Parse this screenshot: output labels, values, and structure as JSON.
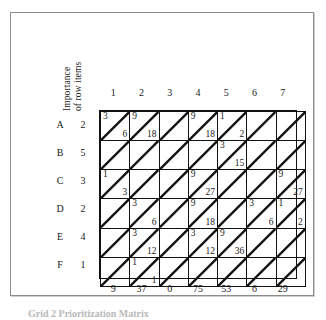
{
  "figure": {
    "row_axis_label_line1": "Importance",
    "row_axis_label_line2": "of row items",
    "caption": "Grid 2  Prioritization Matrix"
  },
  "chart_data": {
    "type": "table",
    "title": "Prioritization matrix",
    "xlabel": "",
    "ylabel": "Importance of row items",
    "grid": true,
    "legend": "none",
    "columns": [
      "1",
      "2",
      "3",
      "4",
      "5",
      "6",
      "7"
    ],
    "rows": [
      "A",
      "B",
      "C",
      "D",
      "E",
      "F"
    ],
    "row_importance": [
      2,
      5,
      3,
      2,
      4,
      1
    ],
    "column_totals": [
      9,
      37,
      0,
      75,
      53,
      6,
      29
    ],
    "cell_notation": "upper-left value = rating, lower-right value = rating x row importance",
    "cells": [
      [
        {
          "top": "3",
          "bottom": "6"
        },
        {
          "top": "9",
          "bottom": "18"
        },
        {
          "top": "",
          "bottom": ""
        },
        {
          "top": "9",
          "bottom": "18"
        },
        {
          "top": "1",
          "bottom": "2"
        },
        {
          "top": "",
          "bottom": ""
        },
        {
          "top": "",
          "bottom": ""
        }
      ],
      [
        {
          "top": "",
          "bottom": ""
        },
        {
          "top": "",
          "bottom": ""
        },
        {
          "top": "",
          "bottom": ""
        },
        {
          "top": "",
          "bottom": ""
        },
        {
          "top": "3",
          "bottom": "15"
        },
        {
          "top": "",
          "bottom": ""
        },
        {
          "top": "",
          "bottom": ""
        }
      ],
      [
        {
          "top": "1",
          "bottom": "3"
        },
        {
          "top": "",
          "bottom": ""
        },
        {
          "top": "",
          "bottom": ""
        },
        {
          "top": "9",
          "bottom": "27"
        },
        {
          "top": "",
          "bottom": ""
        },
        {
          "top": "",
          "bottom": ""
        },
        {
          "top": "9",
          "bottom": "27"
        }
      ],
      [
        {
          "top": "",
          "bottom": ""
        },
        {
          "top": "3",
          "bottom": "6"
        },
        {
          "top": "",
          "bottom": ""
        },
        {
          "top": "9",
          "bottom": "18"
        },
        {
          "top": "",
          "bottom": ""
        },
        {
          "top": "3",
          "bottom": "6"
        },
        {
          "top": "1",
          "bottom": "2"
        }
      ],
      [
        {
          "top": "",
          "bottom": ""
        },
        {
          "top": "3",
          "bottom": "12"
        },
        {
          "top": "",
          "bottom": ""
        },
        {
          "top": "3",
          "bottom": "12"
        },
        {
          "top": "9",
          "bottom": "36"
        },
        {
          "top": "",
          "bottom": ""
        },
        {
          "top": "",
          "bottom": ""
        }
      ],
      [
        {
          "top": "",
          "bottom": ""
        },
        {
          "top": "1",
          "bottom": "1"
        },
        {
          "top": "",
          "bottom": ""
        },
        {
          "top": "",
          "bottom": ""
        },
        {
          "top": "",
          "bottom": ""
        },
        {
          "top": "",
          "bottom": ""
        },
        {
          "top": "",
          "bottom": ""
        }
      ]
    ]
  }
}
